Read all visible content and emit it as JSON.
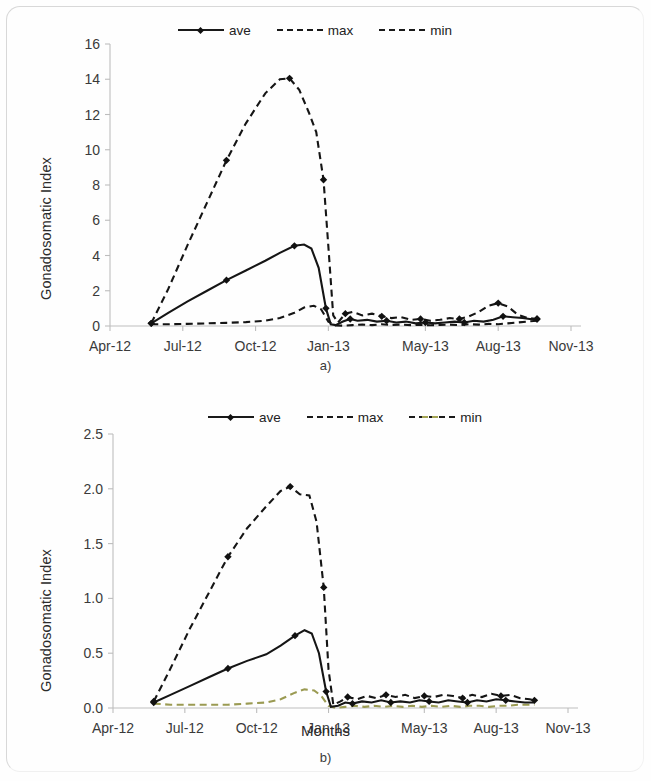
{
  "figure": {
    "panels": [
      {
        "id": "a",
        "caption": "a)",
        "legend": [
          {
            "label": "ave",
            "style": "solid-marker"
          },
          {
            "label": "max",
            "style": "dashed"
          },
          {
            "label": "min",
            "style": "dashed"
          }
        ],
        "ylabel": "Gonadosomatic Index",
        "xlabel": ""
      },
      {
        "id": "b",
        "caption": "b)",
        "legend": [
          {
            "label": "ave",
            "style": "solid-marker"
          },
          {
            "label": "max",
            "style": "dashed"
          },
          {
            "label": "min",
            "style": "dashed-olive"
          }
        ],
        "ylabel": "Gonadosomatic Index",
        "xlabel": "Months"
      }
    ]
  },
  "chart_data": [
    {
      "type": "line",
      "panel": "a",
      "title": "a)",
      "xlabel": "",
      "ylabel": "Gonadosomatic Index",
      "xtick_labels": [
        "Apr-12",
        "Jul-12",
        "Oct-12",
        "Jan-13",
        "May-13",
        "Aug-13",
        "Nov-13"
      ],
      "xtick_values": [
        0,
        3,
        6,
        9,
        13,
        16,
        19
      ],
      "ytick_labels": [
        "0",
        "2",
        "4",
        "6",
        "8",
        "10",
        "12",
        "14",
        "16"
      ],
      "ylim": [
        0,
        16
      ],
      "xlim": [
        0,
        19
      ],
      "grid": false,
      "legend_position": "top-center",
      "series": [
        {
          "name": "ave",
          "style": "solid",
          "markers": true,
          "x": [
            1.7,
            2.4,
            3.2,
            4.0,
            4.8,
            5.6,
            6.4,
            7.0,
            7.6,
            8.0,
            8.3,
            8.6,
            8.9,
            9.1,
            9.3,
            9.6,
            9.9,
            10.2,
            10.6,
            11.0,
            11.4,
            11.8,
            12.2,
            12.6,
            13.0,
            13.4,
            13.8,
            14.2,
            14.6,
            15.0,
            15.4,
            15.8,
            16.2,
            16.6,
            17.0,
            17.3,
            17.6
          ],
          "y": [
            0.15,
            0.75,
            1.4,
            2.0,
            2.6,
            3.15,
            3.7,
            4.15,
            4.55,
            4.62,
            4.4,
            3.3,
            1.0,
            0.1,
            0.05,
            0.25,
            0.4,
            0.3,
            0.35,
            0.25,
            0.3,
            0.2,
            0.25,
            0.15,
            0.2,
            0.15,
            0.2,
            0.25,
            0.2,
            0.3,
            0.25,
            0.35,
            0.55,
            0.5,
            0.45,
            0.4,
            0.4
          ]
        },
        {
          "name": "max",
          "style": "dashed",
          "markers": true,
          "x": [
            1.7,
            2.4,
            3.2,
            4.0,
            4.8,
            5.6,
            6.4,
            7.0,
            7.4,
            7.8,
            8.2,
            8.5,
            8.8,
            9.0,
            9.2,
            9.4,
            9.7,
            10.0,
            10.4,
            10.8,
            11.2,
            11.6,
            12.0,
            12.4,
            12.8,
            13.2,
            13.6,
            14.0,
            14.4,
            14.8,
            15.2,
            15.6,
            16.0,
            16.4,
            16.8,
            17.2,
            17.6
          ],
          "y": [
            0.15,
            2.1,
            4.6,
            7.0,
            9.4,
            11.5,
            13.2,
            14.0,
            14.05,
            13.4,
            12.1,
            11.0,
            8.3,
            4.5,
            0.6,
            0.2,
            0.7,
            0.8,
            0.6,
            0.7,
            0.55,
            0.45,
            0.5,
            0.35,
            0.4,
            0.3,
            0.35,
            0.45,
            0.4,
            0.55,
            0.8,
            1.15,
            1.3,
            1.1,
            0.65,
            0.45,
            0.4
          ]
        },
        {
          "name": "min",
          "style": "dashed",
          "markers": false,
          "x": [
            1.7,
            2.4,
            3.2,
            4.0,
            4.8,
            5.6,
            6.4,
            7.0,
            7.6,
            8.0,
            8.4,
            8.7,
            9.0,
            9.3,
            9.6,
            10.0,
            10.4,
            10.8,
            11.2,
            11.6,
            12.0,
            12.4,
            12.8,
            13.2,
            13.6,
            14.0,
            14.4,
            14.8,
            15.2,
            15.6,
            16.0,
            16.4,
            16.8,
            17.2,
            17.6
          ],
          "y": [
            0.1,
            0.1,
            0.12,
            0.15,
            0.18,
            0.22,
            0.3,
            0.45,
            0.75,
            1.05,
            1.15,
            0.95,
            0.25,
            0.03,
            0.02,
            0.05,
            0.08,
            0.05,
            0.1,
            0.06,
            0.08,
            0.05,
            0.07,
            0.04,
            0.06,
            0.08,
            0.05,
            0.1,
            0.08,
            0.12,
            0.1,
            0.15,
            0.2,
            0.25,
            0.3
          ]
        }
      ]
    },
    {
      "type": "line",
      "panel": "b",
      "title": "b)",
      "xlabel": "Months",
      "ylabel": "Gonadosomatic Index",
      "xtick_labels": [
        "Apr-12",
        "Jul-12",
        "Oct-12",
        "Jan-13",
        "May-13",
        "Aug-13",
        "Nov-13"
      ],
      "xtick_values": [
        0,
        3,
        6,
        9,
        13,
        16,
        19
      ],
      "ytick_labels": [
        "0.0",
        "0.5",
        "1.0",
        "1.5",
        "2.0",
        "2.5"
      ],
      "ylim": [
        0,
        2.5
      ],
      "xlim": [
        0,
        19
      ],
      "grid": false,
      "legend_position": "top-center",
      "series": [
        {
          "name": "ave",
          "style": "solid",
          "markers": true,
          "x": [
            1.7,
            2.4,
            3.2,
            4.0,
            4.8,
            5.6,
            6.4,
            7.0,
            7.6,
            8.0,
            8.3,
            8.6,
            8.9,
            9.1,
            9.4,
            9.7,
            10.0,
            10.4,
            10.8,
            11.2,
            11.6,
            12.0,
            12.4,
            12.8,
            13.2,
            13.6,
            14.0,
            14.4,
            14.8,
            15.2,
            15.6,
            16.0,
            16.4,
            16.8,
            17.2,
            17.6
          ],
          "y": [
            0.05,
            0.12,
            0.2,
            0.28,
            0.36,
            0.43,
            0.49,
            0.57,
            0.66,
            0.71,
            0.68,
            0.5,
            0.15,
            0.01,
            0.02,
            0.05,
            0.04,
            0.06,
            0.05,
            0.07,
            0.05,
            0.06,
            0.05,
            0.07,
            0.06,
            0.05,
            0.07,
            0.06,
            0.05,
            0.07,
            0.06,
            0.08,
            0.07,
            0.06,
            0.05,
            0.05
          ]
        },
        {
          "name": "max",
          "style": "dashed",
          "markers": true,
          "x": [
            1.7,
            2.4,
            3.2,
            4.0,
            4.8,
            5.6,
            6.4,
            7.0,
            7.4,
            7.8,
            8.2,
            8.5,
            8.8,
            9.0,
            9.2,
            9.5,
            9.8,
            10.2,
            10.6,
            11.0,
            11.4,
            11.8,
            12.2,
            12.6,
            13.0,
            13.4,
            13.8,
            14.2,
            14.6,
            15.0,
            15.4,
            15.8,
            16.2,
            16.6,
            17.0,
            17.4,
            17.6
          ],
          "y": [
            0.06,
            0.36,
            0.72,
            1.05,
            1.38,
            1.64,
            1.84,
            1.98,
            2.02,
            1.95,
            1.94,
            1.7,
            1.1,
            0.35,
            0.03,
            0.06,
            0.1,
            0.08,
            0.11,
            0.09,
            0.12,
            0.1,
            0.12,
            0.09,
            0.11,
            0.1,
            0.12,
            0.11,
            0.09,
            0.12,
            0.1,
            0.13,
            0.11,
            0.12,
            0.09,
            0.08,
            0.07
          ]
        },
        {
          "name": "min",
          "style": "dashed-olive",
          "markers": false,
          "x": [
            1.7,
            2.4,
            3.2,
            4.0,
            4.8,
            5.6,
            6.4,
            7.0,
            7.6,
            8.0,
            8.4,
            8.7,
            9.0,
            9.3,
            9.7,
            10.1,
            10.5,
            10.9,
            11.3,
            11.7,
            12.1,
            12.5,
            12.9,
            13.3,
            13.7,
            14.1,
            14.5,
            14.9,
            15.3,
            15.7,
            16.1,
            16.5,
            16.9,
            17.3,
            17.6
          ],
          "y": [
            0.04,
            0.03,
            0.03,
            0.03,
            0.03,
            0.04,
            0.05,
            0.08,
            0.14,
            0.17,
            0.16,
            0.11,
            0.02,
            0.0,
            0.01,
            0.02,
            0.01,
            0.02,
            0.01,
            0.02,
            0.01,
            0.02,
            0.01,
            0.02,
            0.01,
            0.02,
            0.01,
            0.02,
            0.02,
            0.01,
            0.02,
            0.02,
            0.03,
            0.03,
            0.03
          ]
        }
      ]
    }
  ]
}
